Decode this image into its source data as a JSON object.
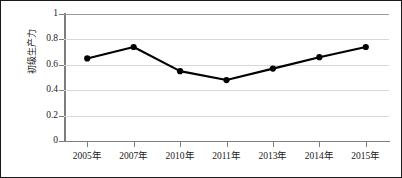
{
  "chart_data": {
    "type": "line",
    "title": "",
    "subtitle": "",
    "xlabel": "",
    "ylabel": "初级生产力",
    "categories": [
      "2005年",
      "2007年",
      "2010年",
      "2011年",
      "2013年",
      "2014年",
      "2015年"
    ],
    "series": [
      {
        "name": "初级生产力",
        "values": [
          0.65,
          0.74,
          0.55,
          0.48,
          0.57,
          0.66,
          0.74
        ],
        "color": "#000000",
        "marker": "circle"
      }
    ],
    "ylim": [
      0,
      1
    ],
    "ytick_labels": [
      "0",
      "0.2",
      "0.4",
      "0.6",
      "0.8",
      "1"
    ],
    "ytick_values": [
      0,
      0.2,
      0.4,
      0.6,
      0.8,
      1
    ],
    "grid": "horizontal",
    "grid_color": "#d8d8d8",
    "legend": "none",
    "axis_color": "#7d7d7d",
    "border_color": "#1a1a1a",
    "background": "#ffffff"
  }
}
